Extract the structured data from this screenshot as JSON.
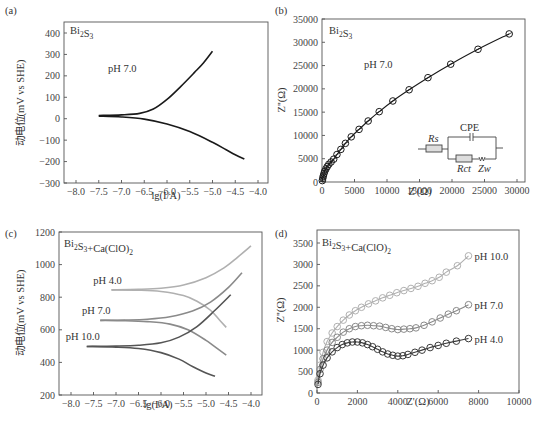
{
  "figure": {
    "panels": [
      "(a)",
      "(b)",
      "(c)",
      "(d)"
    ]
  },
  "chart_data": [
    {
      "panel": "(a)",
      "type": "line",
      "title": "",
      "sample_label": "Bi2S3",
      "annotation": "pH 7.0",
      "xlabel": "lg(I/A)",
      "ylabel": "动电位(mV vs SHE)",
      "xlim": [
        -8.25,
        -3.8
      ],
      "ylim": [
        -300,
        450
      ],
      "xticks": [
        -8.0,
        -7.5,
        -7.0,
        -6.5,
        -6.0,
        -5.5,
        -5.0,
        -4.5,
        -4.0
      ],
      "xtick_labels": [
        "−8.0",
        "−7.5",
        "−7.0",
        "−6.5",
        "−6.0",
        "−5.5",
        "−5.0",
        "−4.5",
        "−4.0"
      ],
      "yticks": [
        -300,
        -200,
        -100,
        0,
        100,
        200,
        300,
        400
      ],
      "ytick_labels": [
        "−300",
        "−200",
        "−100",
        "0",
        "100",
        "200",
        "300",
        "400"
      ],
      "series": [
        {
          "name": "anodic branch",
          "color": "#1a1a1a",
          "x": [
            -7.5,
            -7.0,
            -6.6,
            -6.3,
            -6.0,
            -5.7,
            -5.4,
            -5.2,
            -5.0
          ],
          "y": [
            15,
            18,
            25,
            45,
            90,
            150,
            215,
            260,
            315
          ]
        },
        {
          "name": "cathodic branch",
          "color": "#1a1a1a",
          "x": [
            -7.5,
            -7.0,
            -6.5,
            -6.0,
            -5.5,
            -5.0,
            -4.7,
            -4.5,
            -4.3
          ],
          "y": [
            12,
            8,
            -2,
            -25,
            -60,
            -110,
            -145,
            -168,
            -188
          ]
        }
      ],
      "grid": false
    },
    {
      "panel": "(b)",
      "type": "scatter",
      "title": "",
      "sample_label": "Bi2S3",
      "annotation": "pH 7.0",
      "xlabel": "Z'(Ω)",
      "ylabel": "Z''(Ω)",
      "xlim": [
        0,
        31500
      ],
      "ylim": [
        0,
        35000
      ],
      "xticks": [
        0,
        5000,
        10000,
        15000,
        20000,
        25000,
        30000
      ],
      "yticks": [
        0,
        5000,
        10000,
        15000,
        20000,
        25000,
        30000,
        35000
      ],
      "series": [
        {
          "name": "pH 7.0",
          "color": "#1a1a1a",
          "marker": "circle-cross",
          "x": [
            50,
            120,
            200,
            300,
            420,
            600,
            800,
            1050,
            1400,
            1800,
            2300,
            2900,
            3600,
            4500,
            5700,
            7100,
            8800,
            10900,
            13400,
            16300,
            19800,
            24000,
            28800
          ],
          "y": [
            300,
            800,
            1300,
            1800,
            2300,
            2800,
            3300,
            3800,
            4300,
            4900,
            5900,
            7000,
            8300,
            9700,
            11300,
            13100,
            15100,
            17400,
            19800,
            22400,
            25300,
            28500,
            31800
          ]
        }
      ],
      "inset_circuit": {
        "labels": [
          "Rs",
          "CPE",
          "Rct",
          "Zw"
        ]
      },
      "grid": false
    },
    {
      "panel": "(c)",
      "type": "line",
      "title": "",
      "sample_label": "Bi2S3+Ca(ClO)2",
      "xlabel": "lg(I/A)",
      "ylabel": "动电位(mV vs SHE)",
      "xlim": [
        -8.25,
        -3.8
      ],
      "ylim": [
        200,
        1200
      ],
      "xticks": [
        -8.0,
        -7.5,
        -7.0,
        -6.5,
        -6.0,
        -5.5,
        -5.0,
        -4.5,
        -4.0
      ],
      "xtick_labels": [
        "−8.0",
        "−7.5",
        "−7.0",
        "−6.5",
        "−6.0",
        "−5.5",
        "−5.0",
        "−4.5",
        "−4.0"
      ],
      "yticks": [
        200,
        400,
        600,
        800,
        1000,
        1200
      ],
      "series": [
        {
          "name": "pH 4.0 anodic",
          "label": "pH 4.0",
          "color": "#b0b0b0",
          "x": [
            -7.1,
            -6.5,
            -6.0,
            -5.5,
            -5.0,
            -4.6,
            -4.3,
            -4.0
          ],
          "y": [
            845,
            848,
            855,
            875,
            920,
            980,
            1045,
            1115
          ]
        },
        {
          "name": "pH 4.0 cathodic",
          "color": "#b0b0b0",
          "x": [
            -7.1,
            -6.5,
            -6.0,
            -5.5,
            -5.2,
            -4.9,
            -4.7,
            -4.55
          ],
          "y": [
            845,
            843,
            835,
            810,
            775,
            720,
            660,
            615
          ]
        },
        {
          "name": "pH 7.0 anodic",
          "label": "pH 7.0",
          "color": "#8a8a8a",
          "x": [
            -7.35,
            -6.8,
            -6.3,
            -5.8,
            -5.3,
            -4.9,
            -4.5,
            -4.2
          ],
          "y": [
            658,
            660,
            665,
            680,
            715,
            770,
            860,
            950
          ]
        },
        {
          "name": "pH 7.0 cathodic",
          "color": "#8a8a8a",
          "x": [
            -7.35,
            -6.8,
            -6.3,
            -5.8,
            -5.4,
            -5.0,
            -4.7,
            -4.55
          ],
          "y": [
            658,
            656,
            650,
            635,
            600,
            535,
            475,
            445
          ]
        },
        {
          "name": "pH 10.0 anodic",
          "label": "pH 10.0",
          "color": "#555555",
          "x": [
            -7.65,
            -7.0,
            -6.5,
            -6.0,
            -5.6,
            -5.2,
            -4.8,
            -4.45
          ],
          "y": [
            498,
            500,
            505,
            520,
            555,
            620,
            720,
            815
          ]
        },
        {
          "name": "pH 10.0 cathodic",
          "color": "#555555",
          "x": [
            -7.65,
            -7.0,
            -6.5,
            -6.0,
            -5.6,
            -5.3,
            -5.0,
            -4.8
          ],
          "y": [
            498,
            494,
            485,
            460,
            420,
            375,
            335,
            315
          ]
        }
      ],
      "legend_position": "inline labels",
      "grid": false
    },
    {
      "panel": "(d)",
      "type": "scatter",
      "title": "",
      "sample_label": "Bi2S3+Ca(ClO)2",
      "xlabel": "Z'(Ω)",
      "ylabel": "Z''(Ω)",
      "xlim": [
        0,
        10000
      ],
      "ylim": [
        0,
        3800
      ],
      "xticks": [
        0,
        2000,
        4000,
        6000,
        8000,
        10000
      ],
      "yticks": [
        0,
        500,
        1000,
        1500,
        2000,
        2500,
        3000,
        3500
      ],
      "series": [
        {
          "name": "pH 10.0",
          "label": "pH 10.0",
          "color": "#b0b0b0",
          "marker": "circle",
          "x": [
            50,
            150,
            300,
            500,
            750,
            1000,
            1300,
            1600,
            1900,
            2200,
            2550,
            2900,
            3250,
            3600,
            3950,
            4300,
            4650,
            5000,
            5350,
            5700,
            6050,
            6400,
            6950,
            7500
          ],
          "y": [
            300,
            650,
            950,
            1200,
            1400,
            1550,
            1700,
            1820,
            1920,
            2000,
            2080,
            2150,
            2220,
            2280,
            2340,
            2390,
            2440,
            2490,
            2560,
            2620,
            2700,
            2820,
            2970,
            3200
          ]
        },
        {
          "name": "pH 7.0",
          "label": "pH 7.0",
          "color": "#8a8a8a",
          "marker": "circle",
          "x": [
            50,
            150,
            300,
            500,
            750,
            1000,
            1300,
            1600,
            1900,
            2200,
            2500,
            2800,
            3100,
            3400,
            3700,
            4000,
            4300,
            4600,
            4900,
            5300,
            5700,
            6100,
            6500,
            6900,
            7500
          ],
          "y": [
            250,
            550,
            800,
            1000,
            1180,
            1300,
            1420,
            1500,
            1550,
            1570,
            1580,
            1570,
            1560,
            1530,
            1500,
            1480,
            1490,
            1500,
            1520,
            1580,
            1660,
            1750,
            1840,
            1920,
            2060
          ]
        },
        {
          "name": "pH 4.0",
          "label": "pH 4.0",
          "color": "#3a3a3a",
          "marker": "circle",
          "x": [
            50,
            150,
            300,
            500,
            750,
            1000,
            1250,
            1500,
            1750,
            2000,
            2250,
            2500,
            2750,
            3000,
            3250,
            3500,
            3750,
            4000,
            4250,
            4500,
            4850,
            5200,
            5600,
            6000,
            6400,
            6900,
            7500
          ],
          "y": [
            200,
            450,
            650,
            820,
            960,
            1060,
            1130,
            1170,
            1190,
            1190,
            1170,
            1130,
            1080,
            1020,
            960,
            910,
            880,
            860,
            870,
            900,
            950,
            1000,
            1060,
            1110,
            1160,
            1210,
            1270
          ]
        }
      ],
      "legend_position": "inline labels at right end",
      "grid": false
    }
  ]
}
